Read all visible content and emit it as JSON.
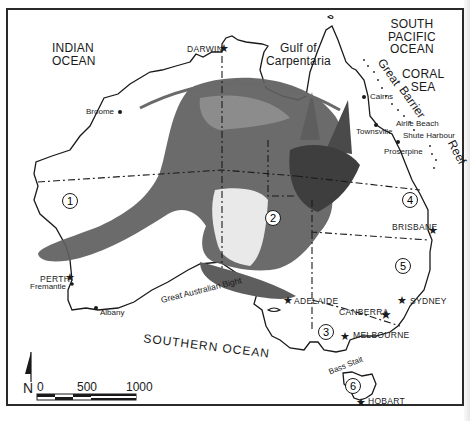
{
  "map": {
    "title": "Australia — states with kangaroo silhouette",
    "oceans": {
      "indian": "INDIAN\nOCEAN",
      "south_pacific": "SOUTH\nPACIFIC\nOCEAN",
      "coral_sea": "CORAL\nSEA",
      "southern": "SOUTHERN OCEAN"
    },
    "water_features": {
      "gulf": "Gulf of\nCarpentaria",
      "reef_great": "Great",
      "reef_barrier": "Barrier",
      "reef_reef": "Reef",
      "bight": "Great  Australian  Bight",
      "bass_strait": "Bass Stait"
    },
    "capitals": [
      {
        "name": "DARWIN",
        "symbol": "star"
      },
      {
        "name": "PERTH",
        "symbol": "star"
      },
      {
        "name": "ADELAIDE",
        "symbol": "star"
      },
      {
        "name": "BRISBANE",
        "symbol": "star"
      },
      {
        "name": "SYDNEY",
        "symbol": "star"
      },
      {
        "name": "CANBERRA",
        "symbol": "star"
      },
      {
        "name": "MELBOURNE",
        "symbol": "star"
      },
      {
        "name": "HOBART",
        "symbol": "star"
      }
    ],
    "towns": [
      {
        "name": "Broome"
      },
      {
        "name": "Cairns"
      },
      {
        "name": "Townsville"
      },
      {
        "name": "Airlie Beach"
      },
      {
        "name": "Shute Harbour"
      },
      {
        "name": "Proserpine"
      },
      {
        "name": "Fremantle"
      },
      {
        "name": "Albany"
      }
    ],
    "regions": [
      "1",
      "2",
      "3",
      "4",
      "5",
      "6"
    ],
    "scale": {
      "north_label": "N",
      "ticks": [
        "0",
        "500",
        "1000"
      ]
    },
    "colors": {
      "ink": "#1a1a1a",
      "kangaroo": "#5e5e5e",
      "kangaroo_light": "#8a8a8a",
      "paper": "#ffffff"
    }
  }
}
